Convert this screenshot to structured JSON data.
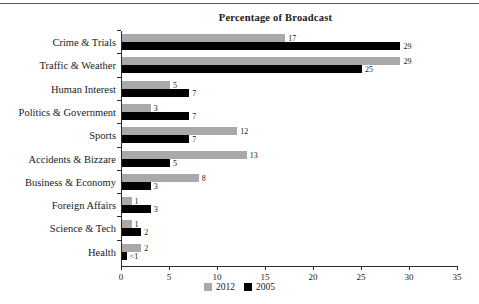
{
  "chart_data": {
    "type": "bar",
    "orientation": "horizontal",
    "title": "Percentage of Broadcast",
    "xlabel": "",
    "ylabel": "",
    "xlim": [
      0,
      35
    ],
    "xticks": [
      0,
      5,
      10,
      15,
      20,
      25,
      30,
      35
    ],
    "grid": false,
    "legend_position": "bottom",
    "categories": [
      "Crime & Trials",
      "Traffic & Weather",
      "Human Interest",
      "Politics & Government",
      "Sports",
      "Accidents & Bizzare",
      "Business & Economy",
      "Foreign Affairs",
      "Science & Tech",
      "Health"
    ],
    "series": [
      {
        "name": "2012",
        "color": "#a9a9a9",
        "values": [
          17,
          29,
          5,
          3,
          12,
          13,
          8,
          1,
          1,
          2
        ],
        "labels": [
          "17",
          "29",
          "5",
          "3",
          "12",
          "13",
          "8",
          "1",
          "1",
          "2"
        ]
      },
      {
        "name": "2005",
        "color": "#000000",
        "values": [
          29,
          25,
          7,
          7,
          7,
          5,
          3,
          3,
          2,
          0.5
        ],
        "labels": [
          "29",
          "25",
          "7",
          "7",
          "7",
          "5",
          "3",
          "3",
          "2",
          "<1"
        ]
      }
    ]
  },
  "axis": {
    "tick_labels": [
      "0",
      "5",
      "10",
      "15",
      "20",
      "25",
      "30",
      "35"
    ]
  },
  "legend": {
    "items": [
      {
        "label": "2012",
        "color": "#a9a9a9"
      },
      {
        "label": "2005",
        "color": "#000000"
      }
    ]
  },
  "colors": {
    "series_2012": "#a9a9a9",
    "series_2005": "#000000",
    "axis": "#2b2b2b",
    "rule": "#555555",
    "background": "#ffffff"
  }
}
